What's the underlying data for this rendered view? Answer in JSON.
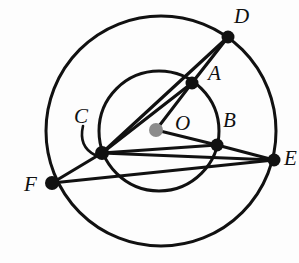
{
  "figure": {
    "type": "geometry-diagram",
    "width": 299,
    "height": 263,
    "background_color": "#fdfdfd",
    "stroke_color": "#111111",
    "center_dot_color": "#8c8c8c",
    "point_dot_color": "#111111"
  },
  "circles": [
    {
      "name": "outer-circle",
      "cx": 161,
      "cy": 131,
      "r": 115,
      "stroke_width": 3.0
    },
    {
      "name": "inner-circle",
      "cx": 159,
      "cy": 131,
      "r": 60,
      "stroke_width": 3.0
    }
  ],
  "points": [
    {
      "id": "D",
      "label": "D",
      "x": 228,
      "y": 37,
      "label_x": 234,
      "label_y": 6,
      "dot_r": 6.5,
      "color": "#111111",
      "on": "outer-circle"
    },
    {
      "id": "A",
      "label": "A",
      "x": 192,
      "y": 83,
      "label_x": 208,
      "label_y": 63,
      "dot_r": 6.5,
      "color": "#111111",
      "on": "inner-circle"
    },
    {
      "id": "B",
      "label": "B",
      "x": 217,
      "y": 145,
      "label_x": 223,
      "label_y": 110,
      "dot_r": 6.5,
      "color": "#111111",
      "on": "inner-circle"
    },
    {
      "id": "C",
      "label": "C",
      "x": 102,
      "y": 153,
      "label_x": 74,
      "label_y": 106,
      "dot_r": 7.0,
      "color": "#111111",
      "on": "inner-circle"
    },
    {
      "id": "E",
      "label": "E",
      "x": 274,
      "y": 160,
      "label_x": 284,
      "label_y": 148,
      "dot_r": 6.5,
      "color": "#111111",
      "on": "outer-circle"
    },
    {
      "id": "F",
      "label": "F",
      "x": 52,
      "y": 183,
      "label_x": 24,
      "label_y": 174,
      "dot_r": 7.0,
      "color": "#111111",
      "on": "outer-circle"
    },
    {
      "id": "O",
      "label": "O",
      "x": 156,
      "y": 130,
      "label_x": 175,
      "label_y": 113,
      "dot_r": 7.0,
      "color": "#8c8c8c",
      "on": "center"
    }
  ],
  "segments": [
    {
      "name": "segment-C-A",
      "from": "C",
      "to": "A",
      "x1": 102,
      "y1": 153,
      "x2": 192,
      "y2": 83,
      "stroke_width": 3.2
    },
    {
      "name": "segment-A-D",
      "from": "A",
      "to": "D",
      "x1": 192,
      "y1": 83,
      "x2": 228,
      "y2": 37,
      "stroke_width": 3.2
    },
    {
      "name": "segment-C-D",
      "from": "C",
      "to": "D",
      "x1": 102,
      "y1": 153,
      "x2": 228,
      "y2": 37,
      "stroke_width": 3.2
    },
    {
      "name": "segment-O-A",
      "from": "O",
      "to": "A",
      "x1": 156,
      "y1": 130,
      "x2": 192,
      "y2": 83,
      "stroke_width": 3.0
    },
    {
      "name": "segment-O-B",
      "from": "O",
      "to": "B",
      "x1": 156,
      "y1": 130,
      "x2": 217,
      "y2": 145,
      "stroke_width": 3.0
    },
    {
      "name": "segment-C-E",
      "from": "C",
      "to": "E",
      "x1": 102,
      "y1": 153,
      "x2": 274,
      "y2": 160,
      "stroke_width": 3.2
    },
    {
      "name": "segment-C-B",
      "from": "C",
      "to": "B",
      "x1": 102,
      "y1": 153,
      "x2": 217,
      "y2": 145,
      "stroke_width": 3.2
    },
    {
      "name": "segment-B-E",
      "from": "B",
      "to": "E",
      "x1": 217,
      "y1": 145,
      "x2": 274,
      "y2": 160,
      "stroke_width": 3.2
    },
    {
      "name": "segment-F-C",
      "from": "F",
      "to": "C",
      "x1": 52,
      "y1": 183,
      "x2": 102,
      "y2": 153,
      "stroke_width": 3.2
    },
    {
      "name": "segment-F-E",
      "from": "F",
      "to": "E",
      "x1": 52,
      "y1": 183,
      "x2": 274,
      "y2": 160,
      "stroke_width": 3.2
    }
  ],
  "leaders": [
    {
      "name": "leader-arc-C",
      "for_point": "C",
      "path": "M 83 126 C 80 139, 83 149, 95 155",
      "stroke_width": 2.6
    }
  ]
}
